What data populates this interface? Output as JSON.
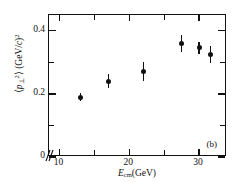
{
  "figure": {
    "panel_label": "(b)",
    "background": "#ffffff",
    "ink_color": "#111111"
  },
  "axes": {
    "x": {
      "title_parts": {
        "symbol": "E",
        "subscript": "cm",
        "unit": "(GeV)"
      },
      "title_plain": "E_cm(GeV)",
      "major_ticks": [
        10,
        20,
        30
      ],
      "major_tick_labels": [
        "10",
        "20",
        "30"
      ],
      "minor_ticks": [
        15,
        25
      ],
      "range": [
        8.5,
        34
      ],
      "has_break_near_origin": true
    },
    "y": {
      "title_parts": {
        "bracket_open": "⟨",
        "symbol": "p",
        "subscript": "⊥",
        "superscript": "2",
        "bracket_close": "⟩",
        "unit": "(GeV/c)",
        "unit_superscript": "2"
      },
      "title_plain": "⟨p⊥²⟩ (GeV/c)²",
      "major_ticks": [
        0,
        0.2,
        0.4
      ],
      "major_tick_labels": [
        "0",
        "0.2",
        "0.4"
      ],
      "minor_ticks": [
        0.1,
        0.3
      ],
      "range": [
        0,
        0.45
      ]
    },
    "frame": "box",
    "ticks_inward": false,
    "grid": false
  },
  "chart_data": {
    "type": "scatter",
    "title": "",
    "subtitle": "",
    "xlabel": "E_cm(GeV)",
    "ylabel": "⟨p⊥²⟩ (GeV/c)²",
    "xlim": [
      8.5,
      34
    ],
    "ylim": [
      0,
      0.45
    ],
    "grid": false,
    "legend": null,
    "annotations": [
      {
        "text": "(b)",
        "position": "bottom-right"
      }
    ],
    "series": [
      {
        "name": "mean transverse momentum squared",
        "marker": "filled-circle",
        "color": "#111111",
        "x": [
          13.0,
          17.0,
          22.0,
          27.5,
          30.0,
          31.6
        ],
        "y": [
          0.19,
          0.24,
          0.272,
          0.36,
          0.346,
          0.325
        ],
        "yerr": [
          0.013,
          0.022,
          0.03,
          0.027,
          0.018,
          0.026
        ],
        "points": [
          {
            "x": 13.0,
            "y": 0.19,
            "yerr": 0.013
          },
          {
            "x": 17.0,
            "y": 0.24,
            "yerr": 0.022
          },
          {
            "x": 22.0,
            "y": 0.272,
            "yerr": 0.03
          },
          {
            "x": 27.5,
            "y": 0.36,
            "yerr": 0.027
          },
          {
            "x": 30.0,
            "y": 0.346,
            "yerr": 0.018
          },
          {
            "x": 31.6,
            "y": 0.325,
            "yerr": 0.026
          }
        ]
      }
    ]
  }
}
